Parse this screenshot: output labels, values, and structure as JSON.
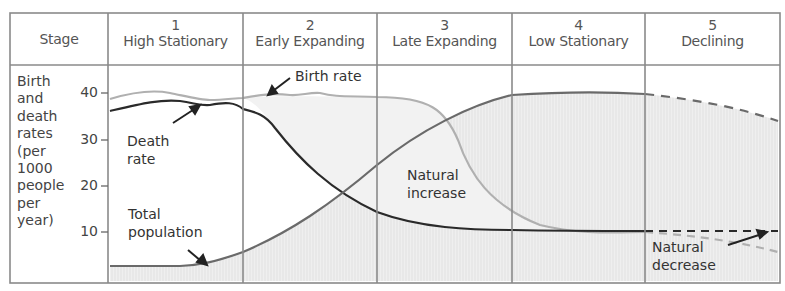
{
  "header": {
    "stage_label": "Stage",
    "stages": [
      {
        "number": "1",
        "name": "High Stationary"
      },
      {
        "number": "2",
        "name": "Early Expanding"
      },
      {
        "number": "3",
        "name": "Late Expanding"
      },
      {
        "number": "4",
        "name": "Low Stationary"
      },
      {
        "number": "5",
        "name": "Declining"
      }
    ]
  },
  "y_axis": {
    "title_lines": [
      "Birth",
      "and",
      "death",
      "rates",
      "(per",
      "1000",
      "people",
      "per",
      "year)"
    ],
    "ticks": [
      "40",
      "30",
      "20",
      "10"
    ]
  },
  "annotations": {
    "birth_rate": "Birth rate",
    "death_rate_1": "Death",
    "death_rate_2": "rate",
    "total_population_1": "Total",
    "total_population_2": "population",
    "natural_increase_1": "Natural",
    "natural_increase_2": "increase",
    "natural_decrease_1": "Natural",
    "natural_decrease_2": "decrease"
  },
  "colors": {
    "grid": "#8a8a8a",
    "birth_rate": "#b0b0b0",
    "death_rate": "#2a2a2a",
    "population": "#6a6a6a",
    "fill": "#ececec"
  }
}
